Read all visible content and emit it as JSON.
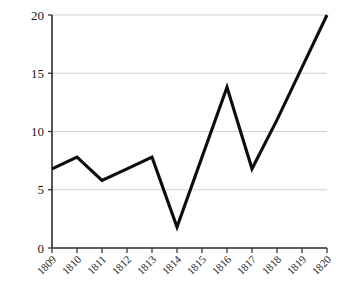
{
  "chart_data": {
    "type": "line",
    "title": "",
    "subtitle": "",
    "xlabel": "",
    "ylabel": "",
    "categories": [
      "1809",
      "1810",
      "1811",
      "1812",
      "1813",
      "1814",
      "1815",
      "1816",
      "1817",
      "1818",
      "1819",
      "1820"
    ],
    "x": [
      1809,
      1810,
      1811,
      1812,
      1813,
      1814,
      1815,
      1816,
      1817,
      1818,
      1819,
      1820
    ],
    "values": [
      6.8,
      7.8,
      5.8,
      6.8,
      7.8,
      1.8,
      7.8,
      13.8,
      6.8,
      11.0,
      15.5,
      20.0
    ],
    "series": [
      {
        "name": "",
        "values": [
          6.8,
          7.8,
          5.8,
          6.8,
          7.8,
          1.8,
          7.8,
          13.8,
          6.8,
          11.0,
          15.5,
          20.0
        ]
      }
    ],
    "ylim": [
      0,
      20
    ],
    "xlim": [
      1809,
      1820
    ],
    "yticks": [
      0,
      5,
      10,
      15,
      20
    ],
    "ytick_labels": [
      "0",
      "5",
      "10",
      "15",
      "20"
    ],
    "xtick_labels": [
      "1809",
      "1810",
      "1811",
      "1812",
      "1813",
      "1814",
      "1815",
      "1816",
      "1817",
      "1818",
      "1819",
      "1820"
    ],
    "grid": "horizontal",
    "legend": "none",
    "legend_entries": [],
    "annotations": [],
    "markers": "none",
    "line_color": "#0d0d0d",
    "grid_color": "#cfcfcf",
    "axis_color": "#2b2b2b",
    "background": "#ffffff",
    "xtick_label_rotation": -45
  }
}
